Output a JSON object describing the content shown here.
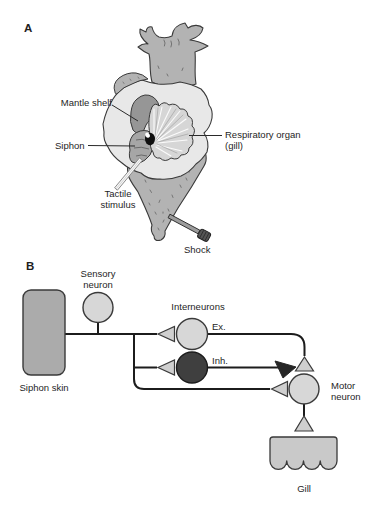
{
  "figure": {
    "panel_a": {
      "label": "A",
      "annotations": {
        "mantle_shelf": "Mantle shelf",
        "siphon": "Siphon",
        "tactile_stimulus": "Tactile stimulus",
        "respiratory_organ": "Respiratory organ (gill)",
        "shock": "Shock"
      }
    },
    "panel_b": {
      "label": "B",
      "nodes": {
        "siphon_skin": "Siphon skin",
        "sensory_neuron": "Sensory neuron",
        "interneurons": "Interneurons",
        "excitatory": "Ex.",
        "inhibitory": "Inh.",
        "motor_neuron": "Motor neuron",
        "gill": "Gill"
      }
    },
    "colors": {
      "background": "#ffffff",
      "text": "#1e1e1e",
      "line": "#1c1c1c",
      "outline": "#3a3a3a",
      "body_gray": "#b3b3b3",
      "parapodia_light": "#e8e8e8",
      "mantle_shelf_dark": "#969696",
      "gill_fan": "#d6d6d6",
      "siphon_gray": "#a6a6a6",
      "neuron_light": "#d7d7d7",
      "neuron_dark": "#3f3f3f",
      "synapse_light": "#cfcfcf",
      "synapse_dark": "#262626",
      "siphon_skin_fill": "#ababab",
      "gill_fill": "#c9c9c9"
    }
  }
}
